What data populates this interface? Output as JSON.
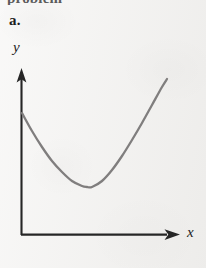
{
  "figure": {
    "part_label": "a.",
    "top_cut_text": "problem",
    "background_color": "#f2f1ef",
    "axis_color": "#262626",
    "curve_color": "#807e7e"
  },
  "axes": {
    "x_label": "x",
    "y_label": "y",
    "x_axis_arrow": "arrow-right",
    "y_axis_arrow": "arrow-up",
    "origin_px": [
      21,
      235
    ],
    "x_axis_end_px": [
      178,
      235
    ],
    "y_axis_end_px": [
      22,
      72
    ],
    "tick_labels_x": [],
    "tick_labels_y": []
  },
  "chart_data": {
    "type": "line",
    "title": "",
    "subtitle": "",
    "xlabel": "x",
    "ylabel": "y",
    "grid": false,
    "legend": [],
    "legend_position": "none",
    "axis_ticks": false,
    "xlim": [
      0,
      10
    ],
    "ylim": [
      0,
      10
    ],
    "annotations": [],
    "series": [
      {
        "name": "curve",
        "color": "#807e7e",
        "x": [
          0.0,
          0.6,
          1.2,
          1.8,
          2.4,
          3.0,
          3.6,
          3.9,
          4.2,
          4.8,
          5.4,
          6.0,
          6.6,
          7.2,
          7.8,
          8.4,
          8.7
        ],
        "y": [
          7.48,
          6.35,
          5.36,
          4.5,
          3.8,
          3.25,
          2.94,
          2.86,
          2.88,
          3.24,
          3.92,
          4.8,
          5.8,
          6.85,
          7.95,
          9.05,
          9.55
        ],
        "pixel_points": [
          [
            22,
            113
          ],
          [
            32,
            131
          ],
          [
            42,
            147
          ],
          [
            52,
            161
          ],
          [
            62,
            172
          ],
          [
            72,
            181
          ],
          [
            82,
            186
          ],
          [
            87,
            187
          ],
          [
            92,
            187
          ],
          [
            102,
            181
          ],
          [
            112,
            170
          ],
          [
            122,
            156
          ],
          [
            132,
            140
          ],
          [
            142,
            123
          ],
          [
            152,
            105
          ],
          [
            162,
            87
          ],
          [
            167,
            79
          ]
        ]
      }
    ],
    "minimum_point": {
      "x_px": 87,
      "y_px": 187,
      "x": 3.9,
      "y": 2.86
    },
    "start_point": {
      "x_px": 22,
      "y_px": 113
    },
    "end_point": {
      "x_px": 167,
      "y_px": 79
    }
  }
}
